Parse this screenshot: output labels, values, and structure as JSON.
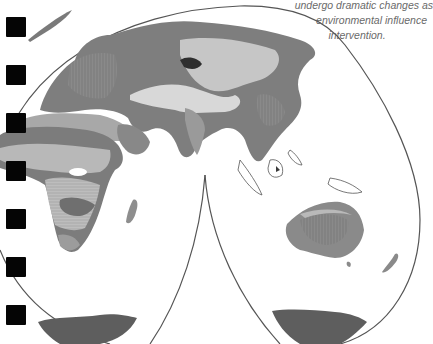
{
  "caption": {
    "lines": [
      "undergo dramatic changes as",
      "environmental influence",
      "intervention."
    ]
  },
  "map": {
    "projection": "interrupted-goode-homolosine",
    "regions": [
      "Europe",
      "Asia",
      "Africa",
      "Arabia",
      "India",
      "Southeast Asia",
      "Australia",
      "New Zealand",
      "Antarctica",
      "Madagascar"
    ],
    "colors": {
      "outline": "#555555",
      "dark": "#6f6f6f",
      "mid": "#8c8c8c",
      "light": "#b4b4b4",
      "pale": "#d6d6d6",
      "darkest": "#2e2e2e"
    }
  },
  "binder_holes": {
    "count": 7,
    "color": "#050505"
  }
}
